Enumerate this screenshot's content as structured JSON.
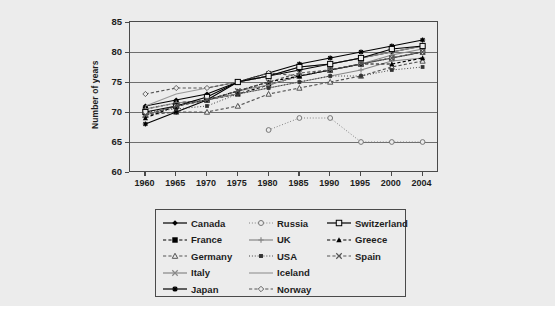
{
  "figure": {
    "background": "#ececec",
    "axis_color": "#4a4a4a",
    "grid_color": "#6e6e6e"
  },
  "chart_data": {
    "type": "line",
    "title": "",
    "xlabel": "",
    "ylabel": "Number of years",
    "x": [
      "1960",
      "1965",
      "1970",
      "1975",
      "1980",
      "1985",
      "1990",
      "1995",
      "2000",
      "2004"
    ],
    "xlim": [
      1958,
      2006
    ],
    "ylim": [
      60,
      85
    ],
    "yticks": [
      "60",
      "65",
      "70",
      "75",
      "80",
      "85"
    ],
    "grid": "horizontal",
    "legend_position": "below",
    "series": [
      {
        "name": "Canada",
        "marker": "filled-diamond",
        "dash": "solid",
        "color": "#000000",
        "values": [
          71,
          72,
          73,
          75,
          76,
          77,
          78,
          79,
          80,
          81
        ]
      },
      {
        "name": "France",
        "marker": "filled-square",
        "dash": "dashed",
        "color": "#000000",
        "values": [
          70.5,
          71.5,
          72,
          73,
          74.5,
          76,
          77,
          78,
          79,
          80
        ]
      },
      {
        "name": "Germany",
        "marker": "open-triangle",
        "dash": "dashed",
        "color": "#555555",
        "values": [
          69.5,
          70,
          70,
          71,
          73,
          74,
          75,
          76,
          77.5,
          78.5
        ]
      },
      {
        "name": "Italy",
        "marker": "x-cross",
        "dash": "solid",
        "color": "#888888",
        "values": [
          69.5,
          71,
          72,
          73.5,
          74.5,
          76,
          77,
          78,
          79.5,
          80.5
        ]
      },
      {
        "name": "Japan",
        "marker": "star",
        "dash": "solid",
        "color": "#000000",
        "values": [
          68,
          70,
          72,
          75,
          76.5,
          78,
          79,
          80,
          81,
          82
        ]
      },
      {
        "name": "Russia",
        "marker": "open-circle",
        "dash": "dotted",
        "color": "#777777",
        "values": [
          null,
          null,
          null,
          null,
          67,
          69,
          69,
          65,
          65,
          65
        ]
      },
      {
        "name": "UK",
        "marker": "plus",
        "dash": "solid",
        "color": "#888888",
        "values": [
          70.5,
          71.5,
          72,
          73,
          74,
          75,
          76,
          77,
          78.5,
          79
        ]
      },
      {
        "name": "USA",
        "marker": "small-filled-square",
        "dash": "dotted",
        "color": "#333333",
        "values": [
          70,
          70.5,
          71,
          73,
          74,
          75,
          76,
          76,
          77,
          77.5
        ]
      },
      {
        "name": "Iceland",
        "marker": "none",
        "dash": "solid",
        "color": "#999999",
        "values": [
          71,
          73,
          74,
          75,
          76,
          77.5,
          78,
          79,
          80,
          81
        ]
      },
      {
        "name": "Norway",
        "marker": "open-diamond",
        "dash": "dashed",
        "color": "#555555",
        "values": [
          73,
          74,
          74,
          75,
          76.5,
          76,
          77,
          78,
          79,
          80
        ]
      },
      {
        "name": "Switzerland",
        "marker": "open-square",
        "dash": "solid",
        "color": "#000000",
        "values": [
          70,
          71,
          72.5,
          75,
          76,
          77.5,
          78,
          79,
          80.5,
          81
        ]
      },
      {
        "name": "Greece",
        "marker": "filled-triangle",
        "dash": "dashed",
        "color": "#000000",
        "values": [
          69,
          71,
          72,
          73.5,
          75,
          76,
          77,
          78,
          78,
          79
        ]
      },
      {
        "name": "Spain",
        "marker": "x-cross",
        "dash": "dashed",
        "color": "#555555",
        "values": [
          69.5,
          71,
          72,
          73.5,
          75,
          76.5,
          77,
          78,
          79,
          80
        ]
      }
    ]
  },
  "legend": {
    "columns": [
      [
        "Canada",
        "France",
        "Germany",
        "Italy",
        "Japan"
      ],
      [
        "Russia",
        "UK",
        "USA",
        "Iceland",
        "Norway"
      ],
      [
        "Switzerland",
        "Greece",
        "Spain"
      ]
    ]
  }
}
